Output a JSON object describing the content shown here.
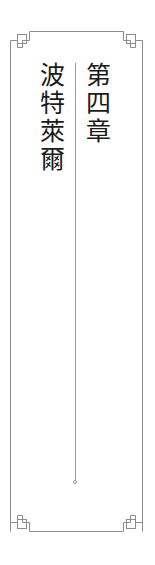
{
  "page": {
    "kind": "book-chapter-title-page",
    "background_color": "#ffffff",
    "width": 155,
    "height": 565
  },
  "frame": {
    "name": "decorative-border-frame",
    "stroke_color": "#8c8c8c",
    "stroke_width": 1,
    "corner_ornament": "stepped-key-square",
    "outer_left": 10,
    "outer_right": 143,
    "outer_top": 31,
    "outer_bottom": 531
  },
  "divider": {
    "name": "vertical-rule",
    "color": "#9a9a9a",
    "terminus": "open-circle",
    "top": 63,
    "bottom": 482
  },
  "content": {
    "chapter_number": "第四章",
    "chapter_title": "波特萊爾",
    "text_color": "#1b1b1b"
  }
}
